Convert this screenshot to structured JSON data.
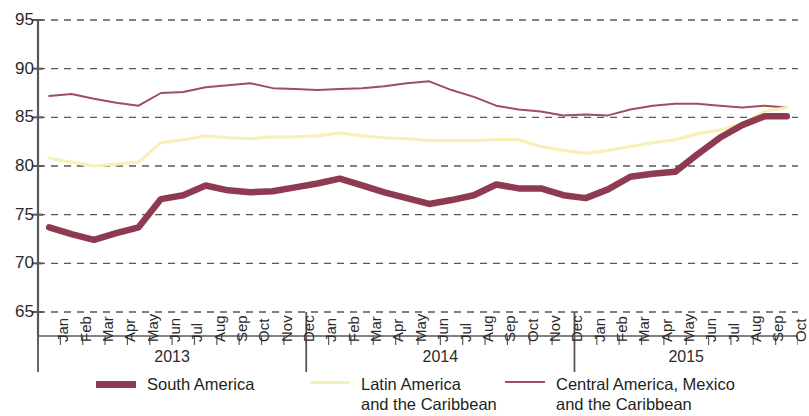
{
  "chart_data": {
    "type": "line",
    "title": "",
    "xlabel": "",
    "ylabel": "",
    "ylim": [
      65,
      95
    ],
    "ytick_step": 5,
    "yticks": [
      95,
      90,
      85,
      80,
      75,
      70,
      65
    ],
    "grid": true,
    "grid_style": "dashed-horizontal",
    "legend_position": "bottom",
    "x": [
      "Jan 2013",
      "Feb 2013",
      "Mar 2013",
      "Apr 2013",
      "May 2013",
      "Jun 2013",
      "Jul 2013",
      "Aug 2013",
      "Sep 2013",
      "Oct 2013",
      "Nov 2013",
      "Dec 2013",
      "Jan 2014",
      "Feb 2014",
      "Mar 2014",
      "Apr 2014",
      "May 2014",
      "Jun 2014",
      "Jul 2014",
      "Aug 2014",
      "Sep 2014",
      "Oct 2014",
      "Nov 2014",
      "Dec 2014",
      "Jan 2015",
      "Feb 2015",
      "Mar 2015",
      "Apr 2015",
      "May 2015",
      "Jun 2015",
      "Jul 2015",
      "Aug 2015",
      "Sep 2015",
      "Oct 2015"
    ],
    "categories": [
      "Jan",
      "Feb",
      "Mar",
      "Apr",
      "May",
      "Jun",
      "Jul",
      "Aug",
      "Sep",
      "Oct",
      "Nov",
      "Dec",
      "Jan",
      "Feb",
      "Mar",
      "Apr",
      "May",
      "Jun",
      "Jul",
      "Aug",
      "Sep",
      "Oct",
      "Nov",
      "Dec",
      "Jan",
      "Feb",
      "Mar",
      "Apr",
      "May",
      "Jun",
      "Jul",
      "Aug",
      "Sep",
      "Oct"
    ],
    "year_groups": [
      {
        "label": "2013",
        "start_index": 0,
        "end_index": 11
      },
      {
        "label": "2014",
        "start_index": 12,
        "end_index": 23
      },
      {
        "label": "2015",
        "start_index": 24,
        "end_index": 33
      }
    ],
    "series": [
      {
        "name": "South America",
        "color": "#8E3B52",
        "width": 6.5,
        "values": [
          73.7,
          73.0,
          72.4,
          73.1,
          73.7,
          76.6,
          77.0,
          78.0,
          77.5,
          77.3,
          77.4,
          77.8,
          78.2,
          78.7,
          78.0,
          77.3,
          76.7,
          76.1,
          76.5,
          77.0,
          78.1,
          77.7,
          77.7,
          77.0,
          76.7,
          77.6,
          78.9,
          79.2,
          79.4,
          81.2,
          82.9,
          84.2,
          85.1,
          85.1
        ]
      },
      {
        "name": "Latin America\nand the Caribbean",
        "color": "#F7F0B8",
        "width": 3.2,
        "values": [
          80.8,
          80.4,
          80.0,
          80.2,
          80.4,
          82.4,
          82.7,
          83.1,
          82.9,
          82.8,
          83.0,
          83.0,
          83.1,
          83.4,
          83.1,
          82.9,
          82.8,
          82.6,
          82.6,
          82.6,
          82.7,
          82.7,
          82.0,
          81.6,
          81.3,
          81.6,
          82.0,
          82.4,
          82.7,
          83.3,
          83.7,
          84.3,
          85.6,
          86.0
        ]
      },
      {
        "name": "Central America, Mexico\nand the Caribbean",
        "color": "#9E4D63",
        "width": 2.0,
        "values": [
          87.2,
          87.4,
          86.9,
          86.5,
          86.2,
          87.5,
          87.6,
          88.1,
          88.3,
          88.5,
          88.0,
          87.9,
          87.8,
          87.9,
          88.0,
          88.2,
          88.5,
          88.7,
          87.8,
          87.1,
          86.2,
          85.8,
          85.6,
          85.2,
          85.3,
          85.2,
          85.8,
          86.2,
          86.4,
          86.4,
          86.2,
          86.0,
          86.2,
          86.0
        ]
      }
    ],
    "axis_color": "#58585b",
    "grid_color": "#58585b",
    "background": "#ffffff"
  },
  "yaxis": {
    "labels": [
      "95",
      "90",
      "85",
      "80",
      "75",
      "70",
      "65"
    ]
  },
  "legend": {
    "items": [
      {
        "label": "South America",
        "color": "#8E3B52",
        "thickness": 7
      },
      {
        "label": "Latin America\nand the Caribbean",
        "color": "#F7F0B8",
        "thickness": 3
      },
      {
        "label": "Central America, Mexico\nand the Caribbean",
        "color": "#9E4D63",
        "thickness": 2
      }
    ]
  }
}
